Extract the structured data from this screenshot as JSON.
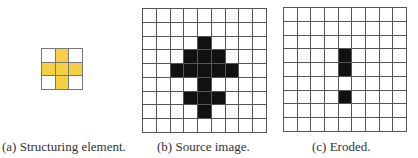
{
  "figure": {
    "panels": [
      {
        "id": "a",
        "caption": "(a) Structuring element.",
        "rows": 3,
        "cols": 3,
        "fill_color": "#f6cf45",
        "filled_cells": [
          [
            0,
            1
          ],
          [
            1,
            0
          ],
          [
            1,
            1
          ],
          [
            1,
            2
          ],
          [
            2,
            1
          ]
        ]
      },
      {
        "id": "b",
        "caption": "(b) Source image.",
        "rows": 9,
        "cols": 9,
        "fill_color": "#111111",
        "filled_cells": [
          [
            2,
            4
          ],
          [
            3,
            3
          ],
          [
            3,
            4
          ],
          [
            3,
            5
          ],
          [
            4,
            2
          ],
          [
            4,
            3
          ],
          [
            4,
            4
          ],
          [
            4,
            5
          ],
          [
            4,
            6
          ],
          [
            5,
            4
          ],
          [
            6,
            3
          ],
          [
            6,
            4
          ],
          [
            6,
            5
          ],
          [
            7,
            4
          ]
        ]
      },
      {
        "id": "c",
        "caption": "(c) Eroded.",
        "rows": 9,
        "cols": 9,
        "fill_color": "#111111",
        "filled_cells": [
          [
            3,
            4
          ],
          [
            4,
            4
          ],
          [
            6,
            4
          ]
        ]
      }
    ]
  }
}
